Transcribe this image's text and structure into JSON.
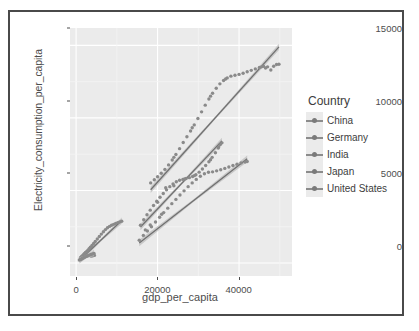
{
  "window": {
    "border_color": "#4a4a4a",
    "background": "#ffffff"
  },
  "chart_data": {
    "type": "scatter",
    "title": "",
    "xlabel": "gdp_per_capita",
    "ylabel": "Electricity_consumption_per_capita",
    "xlim": [
      -1500,
      53000
    ],
    "ylim": [
      -900,
      16200
    ],
    "xticks": [
      0,
      20000,
      40000
    ],
    "xtick_labels": [
      "0",
      "20000",
      "40000"
    ],
    "yticks": [
      0,
      5000,
      10000,
      15000
    ],
    "ytick_labels": [
      "0",
      "5000",
      "10000",
      "15000"
    ],
    "grid": true,
    "panel_background": "#ebebeb",
    "gridline_color": "#ffffff",
    "legend": {
      "title": "Country",
      "position": "right",
      "entries": [
        {
          "label": "China",
          "color": "#8c8c8c"
        },
        {
          "label": "Germany",
          "color": "#8c8c8c"
        },
        {
          "label": "India",
          "color": "#8c8c8c"
        },
        {
          "label": "Japan",
          "color": "#8c8c8c"
        },
        {
          "label": "United States",
          "color": "#8c8c8c"
        }
      ]
    },
    "point_color": "#8a8a8a",
    "fit_line_color": "#707070",
    "confidence_band_color": "#bdbdbd",
    "series": [
      {
        "name": "China",
        "color": "#8c8c8c",
        "points": [
          [
            1100,
            380
          ],
          [
            1300,
            430
          ],
          [
            1500,
            480
          ],
          [
            1700,
            530
          ],
          [
            1900,
            600
          ],
          [
            2100,
            660
          ],
          [
            2300,
            720
          ],
          [
            2600,
            790
          ],
          [
            2900,
            880
          ],
          [
            3200,
            980
          ],
          [
            3500,
            1080
          ],
          [
            3900,
            1200
          ],
          [
            4300,
            1340
          ],
          [
            4700,
            1480
          ],
          [
            5200,
            1650
          ],
          [
            5700,
            1820
          ],
          [
            6200,
            1990
          ],
          [
            6700,
            2150
          ],
          [
            7200,
            2300
          ],
          [
            7700,
            2430
          ],
          [
            8200,
            2520
          ],
          [
            8700,
            2600
          ],
          [
            9200,
            2660
          ],
          [
            9700,
            2720
          ],
          [
            10200,
            2780
          ],
          [
            10700,
            2830
          ],
          [
            11200,
            2870
          ],
          [
            4500,
            520
          ],
          [
            4100,
            500
          ],
          [
            3700,
            470
          ]
        ],
        "fit": {
          "x0": 1100,
          "y0": 260,
          "x1": 11200,
          "y1": 2920
        }
      },
      {
        "name": "Germany",
        "color": "#8c8c8c",
        "points": [
          [
            15500,
            1560
          ],
          [
            16500,
            1900
          ],
          [
            17500,
            2200
          ],
          [
            18500,
            2500
          ],
          [
            19500,
            2820
          ],
          [
            20500,
            3150
          ],
          [
            21500,
            3470
          ],
          [
            22500,
            3780
          ],
          [
            23500,
            4090
          ],
          [
            24500,
            4380
          ],
          [
            25500,
            4680
          ],
          [
            26500,
            4970
          ],
          [
            27500,
            5260
          ],
          [
            28500,
            5520
          ],
          [
            29500,
            5760
          ],
          [
            30500,
            5980
          ],
          [
            31500,
            6150
          ],
          [
            32500,
            6250
          ],
          [
            33500,
            6280
          ],
          [
            34500,
            6350
          ],
          [
            35500,
            6430
          ],
          [
            36500,
            6520
          ],
          [
            37500,
            6620
          ],
          [
            38500,
            6720
          ],
          [
            39500,
            6810
          ],
          [
            40500,
            6900
          ],
          [
            41500,
            6960
          ],
          [
            42000,
            7000
          ],
          [
            17000,
            2280
          ],
          [
            18200,
            2620
          ],
          [
            21000,
            3360
          ]
        ],
        "fit": {
          "x0": 15500,
          "y0": 1380,
          "x1": 42000,
          "y1": 7180
        }
      },
      {
        "name": "India",
        "color": "#8c8c8c",
        "points": [
          [
            800,
            200
          ],
          [
            1000,
            230
          ],
          [
            1200,
            260
          ],
          [
            1400,
            290
          ],
          [
            1600,
            320
          ],
          [
            1800,
            350
          ],
          [
            2000,
            380
          ],
          [
            2300,
            420
          ],
          [
            2600,
            460
          ],
          [
            2900,
            500
          ],
          [
            3200,
            540
          ],
          [
            3600,
            580
          ],
          [
            4000,
            620
          ],
          [
            4400,
            660
          ]
        ],
        "fit": {
          "x0": 800,
          "y0": 180,
          "x1": 4400,
          "y1": 690
        }
      },
      {
        "name": "Japan",
        "color": "#8c8c8c",
        "points": [
          [
            15800,
            2600
          ],
          [
            16600,
            2980
          ],
          [
            17400,
            3320
          ],
          [
            18200,
            3640
          ],
          [
            19000,
            3960
          ],
          [
            19800,
            4260
          ],
          [
            20600,
            4530
          ],
          [
            21400,
            4790
          ],
          [
            22200,
            5040
          ],
          [
            23000,
            5260
          ],
          [
            23800,
            5440
          ],
          [
            24600,
            5600
          ],
          [
            25400,
            5700
          ],
          [
            26200,
            5760
          ],
          [
            27000,
            5820
          ],
          [
            27800,
            5880
          ],
          [
            28600,
            5960
          ],
          [
            29400,
            6080
          ],
          [
            30200,
            6260
          ],
          [
            31000,
            6480
          ],
          [
            31800,
            6720
          ],
          [
            32600,
            6980
          ],
          [
            33400,
            7280
          ],
          [
            34200,
            7600
          ],
          [
            34900,
            7920
          ],
          [
            35400,
            8160
          ],
          [
            35800,
            8280
          ],
          [
            24000,
            5320
          ],
          [
            26600,
            5790
          ],
          [
            29000,
            6020
          ],
          [
            33000,
            7120
          ],
          [
            35000,
            8000
          ],
          [
            22000,
            5180
          ],
          [
            20000,
            4180
          ]
        ],
        "fit": {
          "x0": 15800,
          "y0": 2480,
          "x1": 35800,
          "y1": 8420
        }
      },
      {
        "name": "United States",
        "color": "#8c8c8c",
        "points": [
          [
            18300,
            5520
          ],
          [
            19200,
            5740
          ],
          [
            20000,
            5940
          ],
          [
            20900,
            6180
          ],
          [
            21800,
            6450
          ],
          [
            22700,
            6760
          ],
          [
            23600,
            7100
          ],
          [
            24500,
            7480
          ],
          [
            25400,
            7880
          ],
          [
            26300,
            8300
          ],
          [
            27200,
            8700
          ],
          [
            28100,
            9100
          ],
          [
            29000,
            9520
          ],
          [
            29900,
            9960
          ],
          [
            30800,
            10420
          ],
          [
            31700,
            10880
          ],
          [
            32600,
            11300
          ],
          [
            33500,
            11700
          ],
          [
            34400,
            12050
          ],
          [
            35300,
            12350
          ],
          [
            36200,
            12580
          ],
          [
            37100,
            12760
          ],
          [
            38000,
            12880
          ],
          [
            39000,
            12940
          ],
          [
            40000,
            13000
          ],
          [
            41000,
            13080
          ],
          [
            42000,
            13180
          ],
          [
            43000,
            13280
          ],
          [
            44000,
            13380
          ],
          [
            45000,
            13480
          ],
          [
            46000,
            13560
          ],
          [
            47000,
            13520
          ],
          [
            47800,
            13300
          ],
          [
            48500,
            13560
          ],
          [
            49200,
            13680
          ],
          [
            49800,
            13700
          ],
          [
            24000,
            7280
          ],
          [
            28500,
            9320
          ],
          [
            33000,
            11500
          ],
          [
            36700,
            12680
          ],
          [
            45500,
            13520
          ],
          [
            46500,
            13440
          ]
        ],
        "fit": {
          "x0": 18300,
          "y0": 5050,
          "x1": 49800,
          "y1": 14900
        }
      }
    ]
  }
}
